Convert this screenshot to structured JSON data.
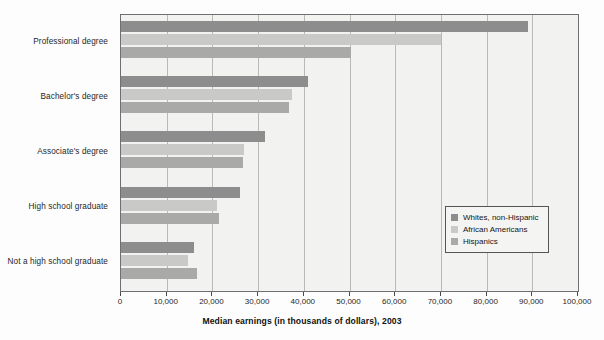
{
  "chart_data": {
    "type": "bar",
    "orientation": "horizontal",
    "title": "",
    "xlabel": "Median earnings (in thousands of dollars), 2003",
    "ylabel": "",
    "xlim": [
      0,
      100000
    ],
    "xticks": [
      0,
      10000,
      20000,
      30000,
      40000,
      50000,
      60000,
      70000,
      80000,
      90000,
      100000
    ],
    "xtick_labels": [
      "0",
      "10,000",
      "20,000",
      "30,000",
      "40,000",
      "50,000",
      "60,000",
      "70,000",
      "80,000",
      "90,000",
      "100,000"
    ],
    "grid": true,
    "grid_axis": "x",
    "legend_position": "center-right-inside",
    "categories": [
      "Professional degree",
      "Bachelor's degree",
      "Associate's degree",
      "High school graduate",
      "Not a high school graduate"
    ],
    "series": [
      {
        "name": "Whites, non-Hispanic",
        "color": "#8d8d8d",
        "values": [
          89000,
          41000,
          31500,
          26000,
          16000
        ]
      },
      {
        "name": "African Americans",
        "color": "#c9c9c7",
        "values": [
          70000,
          37500,
          27000,
          21000,
          14700
        ]
      },
      {
        "name": "Hispanics",
        "color": "#a9a9a7",
        "values": [
          50400,
          36700,
          26700,
          21500,
          16600
        ]
      }
    ]
  },
  "axis": {
    "x_title": "Median earnings (in thousands of dollars), 2003"
  },
  "legend": {
    "entries": [
      {
        "label": "Whites, non-Hispanic"
      },
      {
        "label": "African Americans"
      },
      {
        "label": "Hispanics"
      }
    ]
  },
  "colors": {
    "series_1": "#8d8d8d",
    "series_2": "#c9c9c7",
    "series_3": "#a9a9a7",
    "plot_background": "#f2f2f0",
    "plot_border": "#6f6f6f",
    "gridline": "#b9b9b6",
    "page_background": "#fdfdfd"
  }
}
